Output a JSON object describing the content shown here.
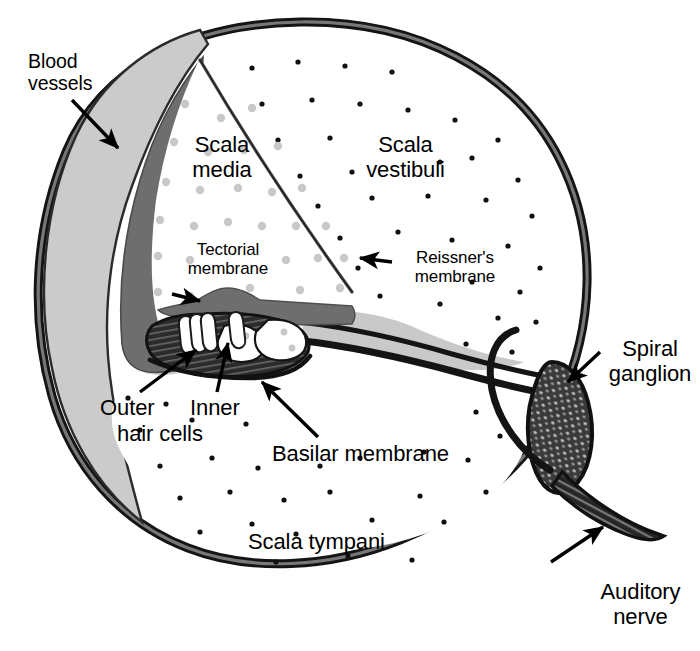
{
  "figure": {
    "background_color": "#ffffff",
    "ink_color": "#000000"
  },
  "palette": {
    "bone_outer": "#cfcfcf",
    "bone_outline": "#1a1a1a",
    "spiral_ligament": "#c9c9c9",
    "stria_vascularis": "#6e6e6e",
    "tectorial_membrane": "#6e6e6e",
    "organ_of_corti": "#2b2b2b",
    "ganglion_fill": "#3a3a3a",
    "fluid_white": "#ffffff",
    "endolymph_dot": "#c8c8c8",
    "perilymph_dot": "#111111"
  },
  "labels": [
    {
      "id": "blood-vessels",
      "text": "Blood\nvessels",
      "x": 28,
      "y": 51,
      "size": "lbl-md",
      "align": "lft",
      "pointer": "arrow",
      "arrow_from": [
        72,
        100
      ],
      "arrow_to": [
        118,
        148
      ]
    },
    {
      "id": "scala-media",
      "text": "Scala\nmedia",
      "x": 167,
      "y": 133,
      "size": "lbl-lg",
      "align": "ctr",
      "pointer": "none"
    },
    {
      "id": "scala-vestibuli",
      "text": "Scala\nvestibuli",
      "x": 343,
      "y": 133,
      "size": "lbl-lg",
      "align": "ctr",
      "pointer": "none"
    },
    {
      "id": "tectorial-membrane",
      "text": "Tectorial\nmembrane",
      "x": 168,
      "y": 240,
      "size": "lbl-sm",
      "align": "ctr",
      "pointer": "arrow",
      "arrow_from": [
        172,
        294
      ],
      "arrow_to": [
        200,
        301
      ]
    },
    {
      "id": "reissners-membrane",
      "text": "Reissner's\nmembrane",
      "x": 395,
      "y": 248,
      "size": "lbl-sm",
      "align": "ctr",
      "pointer": "arrow",
      "arrow_from": [
        392,
        262
      ],
      "arrow_to": [
        360,
        258
      ]
    },
    {
      "id": "spiral-ganglion",
      "text": "Spiral\nganglion",
      "x": 600,
      "y": 337,
      "size": "lbl-lg",
      "align": "ctr",
      "pointer": "arrow",
      "arrow_from": [
        600,
        352
      ],
      "arrow_to": [
        568,
        382
      ]
    },
    {
      "id": "outer-hair-cells",
      "text": "Outer",
      "x": 100,
      "y": 396,
      "size": "lbl-lg",
      "align": "lft",
      "pointer": "arrow",
      "arrow_from": [
        140,
        392
      ],
      "arrow_to": [
        196,
        350
      ]
    },
    {
      "id": "inner-hair-cells",
      "text": "Inner",
      "x": 190,
      "y": 396,
      "size": "lbl-lg",
      "align": "lft",
      "pointer": "arrow",
      "arrow_from": [
        217,
        392
      ],
      "arrow_to": [
        228,
        343
      ]
    },
    {
      "id": "hair-cells-line2",
      "text": "hair cells",
      "x": 117,
      "y": 422,
      "size": "lbl-lg",
      "align": "lft",
      "pointer": "none"
    },
    {
      "id": "basilar-membrane",
      "text": "Basilar membrane",
      "x": 272,
      "y": 442,
      "size": "lbl-lg",
      "align": "lft",
      "pointer": "arrow",
      "arrow_from": [
        318,
        437
      ],
      "arrow_to": [
        262,
        382
      ]
    },
    {
      "id": "scala-tympani",
      "text": "Scala tympani",
      "x": 248,
      "y": 530,
      "size": "lbl-lg",
      "align": "lft",
      "pointer": "none"
    },
    {
      "id": "auditory-nerve",
      "text": "Auditory\nnerve",
      "x": 588,
      "y": 580,
      "size": "lbl-lg",
      "align": "ctr",
      "pointer": "arrow",
      "arrow_from": [
        551,
        562
      ],
      "arrow_to": [
        603,
        527
      ]
    }
  ],
  "structures": [
    {
      "id": "outer-bone-wall",
      "name": "otic capsule bone wall"
    },
    {
      "id": "spiral-ligament",
      "name": "spiral ligament"
    },
    {
      "id": "stria-vascularis",
      "name": "stria vascularis / blood vessels"
    },
    {
      "id": "scala-vestibuli-chamber",
      "name": "scala vestibuli"
    },
    {
      "id": "scala-media-chamber",
      "name": "scala media"
    },
    {
      "id": "scala-tympani-chamber",
      "name": "scala tympani"
    },
    {
      "id": "reissners-membrane-line",
      "name": "Reissner's membrane"
    },
    {
      "id": "tectorial-membrane-band",
      "name": "tectorial membrane"
    },
    {
      "id": "basilar-membrane-line",
      "name": "basilar membrane"
    },
    {
      "id": "organ-of-corti",
      "name": "organ of Corti"
    },
    {
      "id": "outer-hair-cell-group",
      "name": "outer hair cells"
    },
    {
      "id": "inner-hair-cell",
      "name": "inner hair cell"
    },
    {
      "id": "osseous-spiral-lamina",
      "name": "osseous spiral lamina"
    },
    {
      "id": "spiral-ganglion-body",
      "name": "spiral ganglion"
    },
    {
      "id": "auditory-nerve-bundle",
      "name": "auditory nerve"
    }
  ]
}
